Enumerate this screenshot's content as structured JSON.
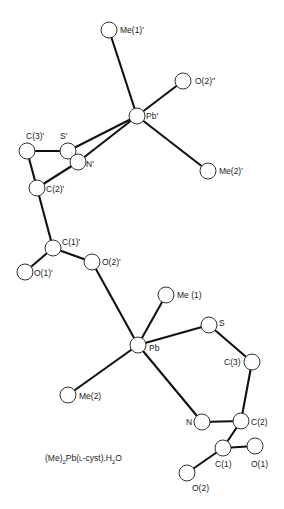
{
  "title": "(Me)2Pb(L-cyst).H2O",
  "caption": {
    "parts": [
      "(Me)",
      "2",
      "Pb(",
      "L",
      "-cyst).H",
      "2",
      "O"
    ],
    "text": "(Me)2Pb(L-cyst).H2O"
  },
  "atoms": {
    "me1p": {
      "label": "Me(1)'",
      "x": 109,
      "y": 30,
      "lx": 120,
      "ly": 33
    },
    "o2pp": {
      "label": "O(2)\"",
      "x": 183,
      "y": 81,
      "lx": 195,
      "ly": 84
    },
    "pbp": {
      "label": "Pb'",
      "x": 137,
      "y": 116,
      "lx": 146,
      "ly": 119
    },
    "c3p": {
      "label": "C(3)'",
      "x": 27,
      "y": 151,
      "lx": 26,
      "ly": 139
    },
    "sp": {
      "label": "S'",
      "x": 68,
      "y": 151,
      "lx": 60,
      "ly": 139
    },
    "np": {
      "label": "N'",
      "x": 78,
      "y": 162,
      "lx": 86,
      "ly": 167
    },
    "me2p": {
      "label": "Me(2)'",
      "x": 208,
      "y": 171,
      "lx": 219,
      "ly": 174
    },
    "c2p": {
      "label": "C(2)'",
      "x": 37,
      "y": 188,
      "lx": 46,
      "ly": 192
    },
    "c1p": {
      "label": "C(1)'",
      "x": 53,
      "y": 248,
      "lx": 62,
      "ly": 245
    },
    "o2p": {
      "label": "O(2)'",
      "x": 92,
      "y": 262,
      "lx": 102,
      "ly": 265
    },
    "o1p": {
      "label": "O(1)'",
      "x": 25,
      "y": 272,
      "lx": 34,
      "ly": 276
    },
    "me1": {
      "label": "Me (1)",
      "x": 166,
      "y": 295,
      "lx": 177,
      "ly": 298
    },
    "s": {
      "label": "S",
      "x": 209,
      "y": 325,
      "lx": 219,
      "ly": 326
    },
    "pb": {
      "label": "Pb",
      "x": 138,
      "y": 345,
      "lx": 149,
      "ly": 351
    },
    "c3": {
      "label": "C(3)",
      "x": 252,
      "y": 362,
      "lx": 224,
      "ly": 365
    },
    "me2": {
      "label": "Me(2)",
      "x": 68,
      "y": 395,
      "lx": 79,
      "ly": 399
    },
    "n": {
      "label": "N",
      "x": 202,
      "y": 422,
      "lx": 186,
      "ly": 425
    },
    "c2": {
      "label": "C(2)",
      "x": 241,
      "y": 421,
      "lx": 251,
      "ly": 425
    },
    "c1": {
      "label": "C(1)",
      "x": 223,
      "y": 448,
      "lx": 215,
      "ly": 467
    },
    "o1": {
      "label": "O(1)",
      "x": 255,
      "y": 446,
      "lx": 251,
      "ly": 467
    },
    "o2": {
      "label": "O(2)",
      "x": 187,
      "y": 473,
      "lx": 192,
      "ly": 491
    }
  },
  "bonds": [
    [
      "me1p",
      "pbp"
    ],
    [
      "o2pp",
      "pbp"
    ],
    [
      "pbp",
      "me2p"
    ],
    [
      "pbp",
      "sp"
    ],
    [
      "pbp",
      "np"
    ],
    [
      "c3p",
      "sp"
    ],
    [
      "c3p",
      "c2p"
    ],
    [
      "np",
      "c2p"
    ],
    [
      "c2p",
      "c1p"
    ],
    [
      "c1p",
      "o2p"
    ],
    [
      "c1p",
      "o1p"
    ],
    [
      "o2p",
      "pb"
    ],
    [
      "pb",
      "me1"
    ],
    [
      "pb",
      "s"
    ],
    [
      "pb",
      "me2"
    ],
    [
      "pb",
      "n"
    ],
    [
      "s",
      "c3"
    ],
    [
      "c3",
      "c2"
    ],
    [
      "n",
      "c2"
    ],
    [
      "c2",
      "c1"
    ],
    [
      "c1",
      "o1"
    ],
    [
      "c1",
      "o2"
    ]
  ]
}
